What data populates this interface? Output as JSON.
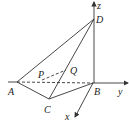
{
  "diagram": {
    "type": "3d-geometry-tetrahedron",
    "points": {
      "A": {
        "label": "A",
        "x": 17,
        "y": 82
      },
      "B": {
        "label": "B",
        "x": 93,
        "y": 83
      },
      "C": {
        "label": "C",
        "x": 49,
        "y": 99
      },
      "D": {
        "label": "D",
        "x": 94,
        "y": 19
      },
      "P": {
        "label": "P",
        "x": 40,
        "y": 78
      },
      "Q": {
        "label": "Q",
        "x": 66,
        "y": 70
      }
    },
    "axes": {
      "x": {
        "label": "x"
      },
      "y": {
        "label": "y"
      },
      "z": {
        "label": "z"
      }
    },
    "line_color": "#333333",
    "dashed_edges": [
      "A-B",
      "P-Q"
    ],
    "solid_edges": [
      "A-D",
      "A-C",
      "C-D",
      "C-B",
      "B-D"
    ]
  }
}
